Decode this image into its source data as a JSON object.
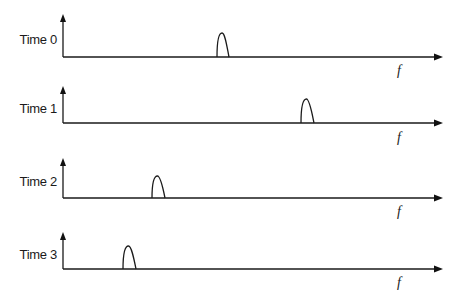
{
  "diagram": {
    "axis_label": "f",
    "colors": {
      "stroke": "#1a1a1a",
      "background": "#ffffff"
    },
    "panels": [
      {
        "label": "Time 0",
        "y_top": 14,
        "y_base": 57,
        "peak_x0": 217,
        "peak_x1": 229,
        "peak_top": 33,
        "f_y": 75
      },
      {
        "label": "Time 1",
        "y_top": 86,
        "y_base": 123,
        "peak_x0": 301,
        "peak_x1": 314,
        "peak_top": 99,
        "f_y": 142
      },
      {
        "label": "Time 2",
        "y_top": 158,
        "y_base": 198,
        "peak_x0": 152,
        "peak_x1": 165,
        "peak_top": 176,
        "f_y": 216
      },
      {
        "label": "Time 3",
        "y_top": 232,
        "y_base": 269,
        "peak_x0": 123,
        "peak_x1": 136,
        "peak_top": 246,
        "f_y": 287
      }
    ]
  }
}
